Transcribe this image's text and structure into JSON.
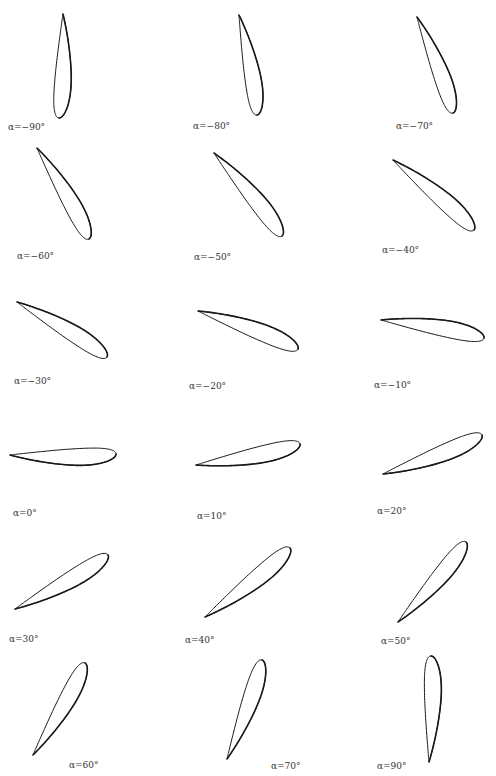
{
  "figure": {
    "stroke_color": "#1a1a1a",
    "background": "#ffffff",
    "panels": [
      {
        "alpha": -90,
        "label": "α=−90°",
        "te": [
          63,
          14
        ],
        "le": [
          59,
          118
        ],
        "label_pos": [
          8,
          122
        ]
      },
      {
        "alpha": -80,
        "label": "α=−80°",
        "te": [
          239,
          15
        ],
        "le": [
          257,
          115
        ],
        "label_pos": [
          193,
          121
        ]
      },
      {
        "alpha": -70,
        "label": "α=−70°",
        "te": [
          417,
          17
        ],
        "le": [
          453,
          113
        ],
        "label_pos": [
          396,
          121
        ]
      },
      {
        "alpha": -60,
        "label": "α=−60°",
        "te": [
          37,
          148
        ],
        "le": [
          89,
          239
        ],
        "label_pos": [
          17,
          251
        ]
      },
      {
        "alpha": -50,
        "label": "α=−50°",
        "te": [
          214,
          153
        ],
        "le": [
          282,
          236
        ],
        "label_pos": [
          194,
          252
        ]
      },
      {
        "alpha": -40,
        "label": "α=−40°",
        "te": [
          393,
          160
        ],
        "le": [
          474,
          230
        ],
        "label_pos": [
          382,
          245
        ]
      },
      {
        "alpha": -30,
        "label": "α=−30°",
        "te": [
          17,
          302
        ],
        "le": [
          107,
          357
        ],
        "label_pos": [
          14,
          376
        ]
      },
      {
        "alpha": -20,
        "label": "α=−20°",
        "te": [
          198,
          311
        ],
        "le": [
          298,
          349
        ],
        "label_pos": [
          189,
          381
        ]
      },
      {
        "alpha": -10,
        "label": "α=−10°",
        "te": [
          381,
          320
        ],
        "le": [
          484,
          338
        ],
        "label_pos": [
          374,
          380
        ]
      },
      {
        "alpha": 0,
        "label": "α=0°",
        "te": [
          10,
          455
        ],
        "le": [
          116,
          454
        ],
        "label_pos": [
          13,
          508
        ]
      },
      {
        "alpha": 10,
        "label": "α=10°",
        "te": [
          196,
          465
        ],
        "le": [
          300,
          444
        ],
        "label_pos": [
          197,
          511
        ]
      },
      {
        "alpha": 20,
        "label": "α=20°",
        "te": [
          383,
          474
        ],
        "le": [
          482,
          435
        ],
        "label_pos": [
          377,
          506
        ]
      },
      {
        "alpha": 30,
        "label": "α=30°",
        "te": [
          15,
          609
        ],
        "le": [
          108,
          555
        ],
        "label_pos": [
          9,
          634
        ]
      },
      {
        "alpha": 40,
        "label": "α=40°",
        "te": [
          205,
          617
        ],
        "le": [
          290,
          548
        ],
        "label_pos": [
          185,
          635
        ]
      },
      {
        "alpha": 50,
        "label": "α=50°",
        "te": [
          398,
          622
        ],
        "le": [
          466,
          542
        ],
        "label_pos": [
          381,
          636
        ]
      },
      {
        "alpha": 60,
        "label": "α=60°",
        "te": [
          33,
          755
        ],
        "le": [
          85,
          663
        ],
        "label_pos": [
          69,
          760
        ]
      },
      {
        "alpha": 70,
        "label": "α=70°",
        "te": [
          227,
          759
        ],
        "le": [
          262,
          660
        ],
        "label_pos": [
          271,
          761
        ]
      },
      {
        "alpha": 90,
        "label": "α=90°",
        "te": [
          429,
          762
        ],
        "le": [
          431,
          656
        ],
        "label_pos": [
          377,
          761
        ]
      }
    ]
  }
}
